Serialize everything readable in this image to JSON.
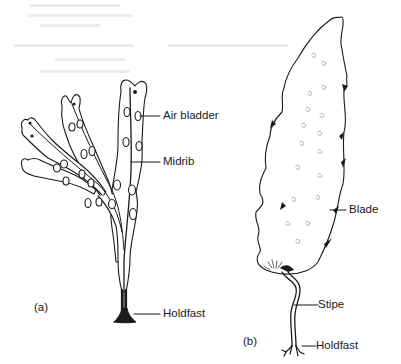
{
  "figure": {
    "panels": [
      {
        "id": "a",
        "label": "(a)",
        "annotations": [
          {
            "key": "air_bladder",
            "text": "Air bladder"
          },
          {
            "key": "midrib",
            "text": "Midrib"
          },
          {
            "key": "holdfast",
            "text": "Holdfast"
          }
        ]
      },
      {
        "id": "b",
        "label": "(b)",
        "annotations": [
          {
            "key": "blade",
            "text": "Blade"
          },
          {
            "key": "stipe",
            "text": "Stipe"
          },
          {
            "key": "holdfast",
            "text": "Holdfast"
          }
        ]
      }
    ]
  },
  "colors": {
    "ink": "#1a1a1a",
    "background": "#ffffff",
    "bleed_through": "#ececec"
  }
}
